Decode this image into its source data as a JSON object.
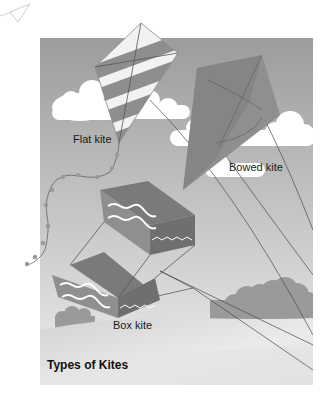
{
  "figure": {
    "title": "Types of Kites",
    "labels": {
      "flat": "Flat kite",
      "bowed": "Bowed kite",
      "box": "Box kite"
    },
    "colors": {
      "sky_top": "#9c9c9c",
      "sky_bottom": "#e6e6e6",
      "cloud": "#ffffff",
      "hill_bush": "#9a9a9a",
      "ground": "#d9d9d9",
      "kite_dark": "#7d7d7d",
      "kite_mid": "#8f8f8f",
      "kite_light": "#f2f2f2",
      "string": "#4a4a4a"
    }
  }
}
